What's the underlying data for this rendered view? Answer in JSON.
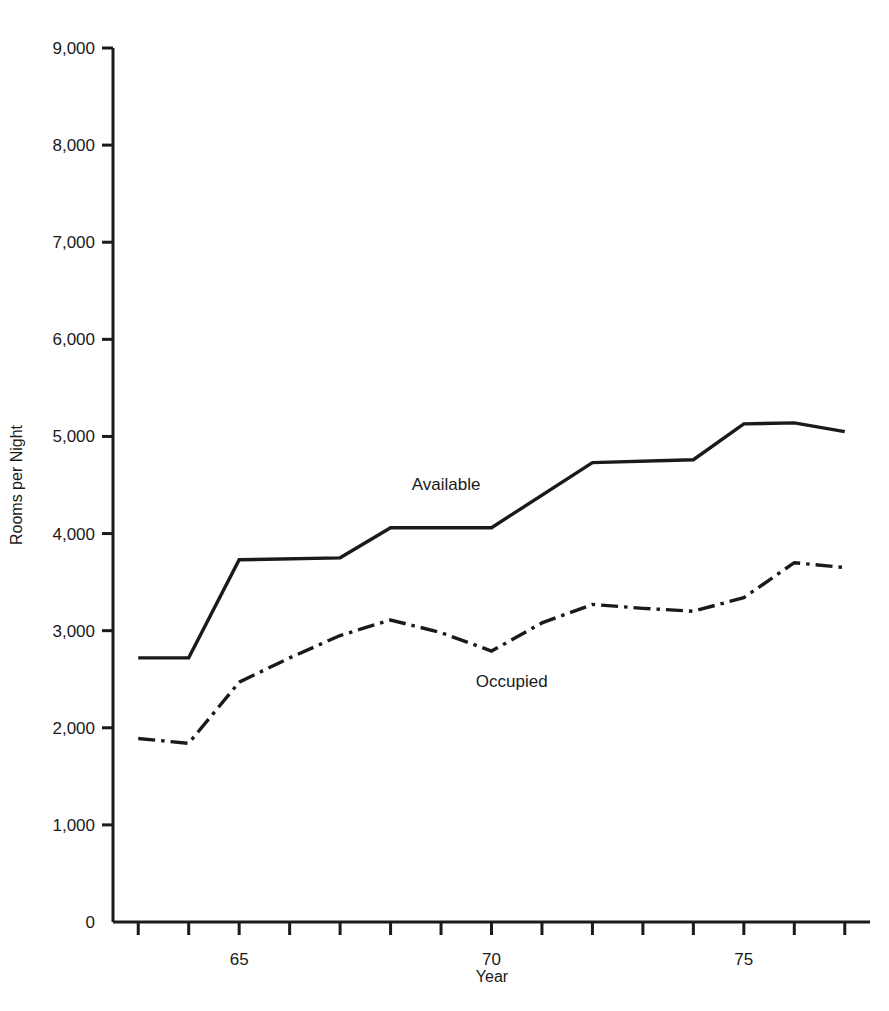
{
  "chart_data": {
    "type": "line",
    "title": "",
    "xlabel": "Year",
    "ylabel": "Rooms per Night",
    "xlim": [
      1962.5,
      1977.5
    ],
    "ylim": [
      0,
      9000
    ],
    "grid": false,
    "legend_position": "inline-annotation",
    "y_ticks": [
      0,
      1000,
      2000,
      3000,
      4000,
      5000,
      6000,
      7000,
      8000,
      9000
    ],
    "y_tick_labels": [
      "0",
      "1,000",
      "2,000",
      "3,000",
      "4,000",
      "5,000",
      "6,000",
      "7,000",
      "8,000",
      "9,000"
    ],
    "x_ticks": [
      1963,
      1964,
      1965,
      1966,
      1967,
      1968,
      1969,
      1970,
      1971,
      1972,
      1973,
      1974,
      1975,
      1976,
      1977
    ],
    "x_tick_labels": [
      "",
      "",
      "65",
      "",
      "",
      "",
      "",
      "70",
      "",
      "",
      "",
      "",
      "75",
      "",
      ""
    ],
    "x_labeled_ticks": [
      {
        "x": 1965,
        "label": "65"
      },
      {
        "x": 1970,
        "label": "70"
      },
      {
        "x": 1975,
        "label": "75"
      }
    ],
    "series": [
      {
        "name": "Available",
        "style": "solid",
        "color": "#1a1a1a",
        "annotation": "Available",
        "annotation_x": 1969.1,
        "annotation_y": 4450,
        "x": [
          1963,
          1964,
          1965,
          1967,
          1968,
          1970,
          1972,
          1974,
          1975,
          1976,
          1977
        ],
        "values": [
          2720,
          2720,
          3730,
          3750,
          4060,
          4060,
          4730,
          4760,
          5130,
          5140,
          5050
        ]
      },
      {
        "name": "Occupied",
        "style": "dashdot",
        "color": "#1a1a1a",
        "annotation": "Occupied",
        "annotation_x": 1970.4,
        "annotation_y": 2420,
        "x": [
          1963,
          1964,
          1965,
          1966,
          1967,
          1968,
          1969,
          1970,
          1971,
          1972,
          1973,
          1974,
          1975,
          1976,
          1977
        ],
        "values": [
          1890,
          1840,
          2470,
          2720,
          2950,
          3110,
          2980,
          2790,
          3080,
          3270,
          3230,
          3200,
          3340,
          3700,
          3650
        ]
      }
    ]
  }
}
